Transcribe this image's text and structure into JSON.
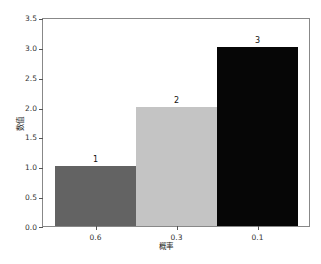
{
  "chart_data": {
    "type": "bar",
    "title": "",
    "xlabel": "概率",
    "ylabel": "数值",
    "categories": [
      "0.6",
      "0.3",
      "0.1"
    ],
    "values": [
      1,
      2,
      3
    ],
    "bar_labels": [
      "1",
      "2",
      "3"
    ],
    "colors": [
      "#636363",
      "#c4c4c4",
      "#060606"
    ],
    "ylim": [
      0,
      3.5
    ],
    "yticks": [
      "0.0",
      "0.5",
      "1.0",
      "1.5",
      "2.0",
      "2.5",
      "3.0",
      "3.5"
    ],
    "grid": false,
    "legend": null
  }
}
